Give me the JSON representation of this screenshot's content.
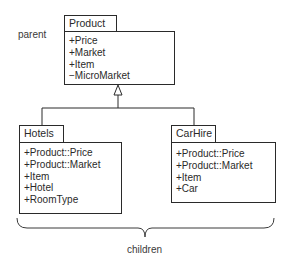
{
  "diagram": {
    "type": "UML class inheritance",
    "annotations": {
      "parent_label": "parent",
      "children_label": "children"
    },
    "classes": {
      "product": {
        "name": "Product",
        "attributes": [
          "+Price",
          "+Market",
          "+Item",
          "−MicroMarket"
        ]
      },
      "hotels": {
        "name": "Hotels",
        "attributes": [
          "+Product::Price",
          "+Product::Market",
          "+Item",
          "+Hotel",
          "+RoomType"
        ]
      },
      "carhire": {
        "name": "CarHire",
        "attributes": [
          "+Product::Price",
          "+Product::Market",
          "+Item",
          "+Car"
        ]
      }
    },
    "relationships": [
      {
        "type": "generalization",
        "from": "Hotels",
        "to": "Product"
      },
      {
        "type": "generalization",
        "from": "CarHire",
        "to": "Product"
      }
    ],
    "colors": {
      "line": "#2a2a2a",
      "background": "#ffffff"
    }
  }
}
